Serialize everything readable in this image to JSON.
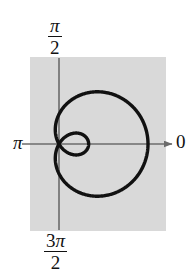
{
  "figure": {
    "kind": "polar-plot",
    "background_color": "#d9d9d9",
    "panel": {
      "x": 30,
      "y": 57,
      "width": 136,
      "height": 174
    },
    "axis_color": "#6b6b6b",
    "curve_color": "#111111",
    "curve_width": 3.4,
    "pole": {
      "x": 59,
      "y": 144
    }
  },
  "labels": {
    "top": {
      "numerator": "π",
      "denominator": "2",
      "name": "pi-over-two"
    },
    "bottom": {
      "numerator_coefficient": "3",
      "numerator_symbol": "π",
      "denominator": "2",
      "name": "three-pi-over-two"
    },
    "left": "π",
    "right": "0"
  },
  "chart_data": {
    "type": "line",
    "title": "",
    "xlabel": "",
    "ylabel": "",
    "coordinate_system": "polar",
    "curve_name": "limacon-with-inner-loop",
    "equation": "r = a + b cos(theta)",
    "parameters": {
      "a": 1,
      "b": 2
    },
    "angle_labels": [
      "0",
      "π/2",
      "π",
      "3π/2"
    ],
    "axis_ranges": {
      "theta": [
        0,
        6.283185
      ],
      "r_max": 3
    },
    "grid": false,
    "legend": "none",
    "features": {
      "outer_loop_right_extent_px": 148,
      "outer_loop_left_extent_px": 52,
      "outer_loop_top_px": 88,
      "outer_loop_bottom_px": 203,
      "inner_loop_right_extent_px": 92,
      "pole_crossings": 2
    },
    "theta_r_samples": [
      {
        "theta": 0.0,
        "r": 3.0
      },
      {
        "theta": 0.3927,
        "r": 2.848
      },
      {
        "theta": 0.7854,
        "r": 2.414
      },
      {
        "theta": 1.1781,
        "r": 1.765
      },
      {
        "theta": 1.5708,
        "r": 1.0
      },
      {
        "theta": 1.9635,
        "r": 0.235
      },
      {
        "theta": 2.0944,
        "r": 0.0
      },
      {
        "theta": 2.3562,
        "r": -0.414
      },
      {
        "theta": 2.7489,
        "r": -0.848
      },
      {
        "theta": 3.1416,
        "r": -1.0
      },
      {
        "theta": 3.5343,
        "r": -0.848
      },
      {
        "theta": 3.927,
        "r": -0.414
      },
      {
        "theta": 4.1888,
        "r": 0.0
      },
      {
        "theta": 4.3197,
        "r": 0.235
      },
      {
        "theta": 4.7124,
        "r": 1.0
      },
      {
        "theta": 5.1051,
        "r": 1.765
      },
      {
        "theta": 5.4978,
        "r": 2.414
      },
      {
        "theta": 5.8905,
        "r": 2.848
      },
      {
        "theta": 6.2832,
        "r": 3.0
      }
    ]
  }
}
